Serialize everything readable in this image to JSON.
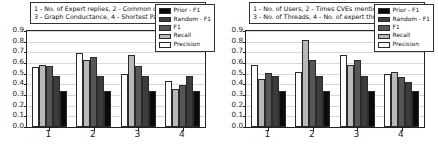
{
  "chart_data": [
    {
      "id": "left",
      "type": "bar",
      "title": "",
      "caption_lines": [
        "1 - No. of Expert replies, 2 - Common communities",
        "3 - Graph Conductance, 4 - Shortest Path"
      ],
      "categories": [
        "1",
        "2",
        "3",
        "4"
      ],
      "xlabel": "",
      "ylabel": "",
      "ylim": [
        0.0,
        0.9
      ],
      "yticks": [
        "0.0",
        "0.1",
        "0.2",
        "0.3",
        "0.4",
        "0.5",
        "0.6",
        "0.7",
        "0.8",
        "0.9"
      ],
      "grid": true,
      "legend_position": "upper right",
      "series": [
        {
          "name": "Prior - F1",
          "color": "#0a0a0a",
          "values": [
            0.335,
            0.335,
            0.335,
            0.335
          ]
        },
        {
          "name": "Random - F1",
          "color": "#3c3c3c",
          "values": [
            0.48,
            0.475,
            0.475,
            0.475
          ]
        },
        {
          "name": "F1",
          "color": "#565656",
          "values": [
            0.575,
            0.655,
            0.575,
            0.395
          ]
        },
        {
          "name": "Recall",
          "color": "#b8b8b8",
          "values": [
            0.585,
            0.63,
            0.675,
            0.355
          ]
        },
        {
          "name": "Precision",
          "color": "#fdfdfd",
          "values": [
            0.56,
            0.69,
            0.495,
            0.435
          ]
        }
      ]
    },
    {
      "id": "right",
      "type": "bar",
      "title": "",
      "caption_lines": [
        "1 - No. of Users, 2 - Times CVEs mentioned",
        "3 - No. of Threads, 4 - No. of expert threads"
      ],
      "categories": [
        "1",
        "2",
        "3",
        "4"
      ],
      "xlabel": "",
      "ylabel": "",
      "ylim": [
        0.0,
        0.9
      ],
      "yticks": [
        "0.0",
        "0.1",
        "0.2",
        "0.3",
        "0.4",
        "0.5",
        "0.6",
        "0.7",
        "0.8",
        "0.9"
      ],
      "grid": true,
      "legend_position": "upper right",
      "series": [
        {
          "name": "Prior - F1",
          "color": "#0a0a0a",
          "values": [
            0.335,
            0.335,
            0.335,
            0.335
          ]
        },
        {
          "name": "Random - F1",
          "color": "#3c3c3c",
          "values": [
            0.475,
            0.475,
            0.475,
            0.425
          ]
        },
        {
          "name": "F1",
          "color": "#565656",
          "values": [
            0.51,
            0.625,
            0.625,
            0.465
          ]
        },
        {
          "name": "Recall",
          "color": "#b8b8b8",
          "values": [
            0.45,
            0.815,
            0.585,
            0.52
          ]
        },
        {
          "name": "Precision",
          "color": "#fdfdfd",
          "values": [
            0.585,
            0.515,
            0.675,
            0.495
          ]
        }
      ]
    }
  ]
}
